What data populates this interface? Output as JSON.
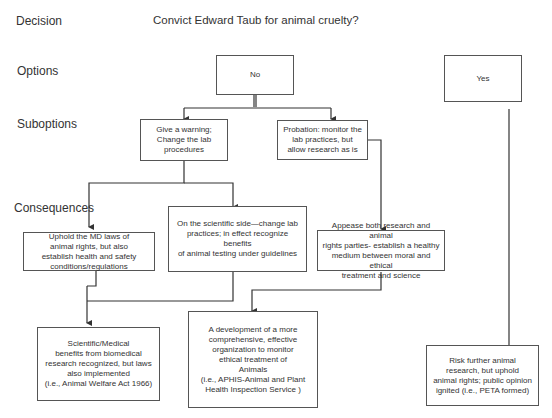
{
  "row_labels": {
    "decision": "Decision",
    "options": "Options",
    "suboptions": "Suboptions",
    "consequences": "Consequences"
  },
  "decision_question": "Convict Edward Taub for animal cruelty?",
  "options": {
    "no": "No",
    "yes": "Yes"
  },
  "suboptions": {
    "warning": "Give a warning;\nChange the lab\nprocedures",
    "probation": "Probation: monitor the\nlab practices, but\nallow research as is"
  },
  "consequences": {
    "uphold_md_laws": "Uphold the MD laws of\nanimal rights, but also\nestablish health and safety\nconditions/regulations",
    "scientific_side": "On the scientific side—change lab\npractices; in effect recognize benefits\nof animal testing under guidelines",
    "appease_both": "Appease both research and animal\nrights parties- establish a healthy\nmedium between moral and ethical\ntreatment and science"
  },
  "outcomes": {
    "scientific_medical": "Scientific/Medical\nbenefits from biomedical\nresearch recognized, but laws\nalso implemented\n(i.e., Animal Welfare Act 1966)",
    "development_org": "A development of a more\ncomprehensive, effective\norganization to monitor\nethical treatment of\nAnimals\n(i.e., APHIS-Animal and Plant\nHealth Inspection Service )",
    "risk_further": "Risk further animal\nresearch, but uphold\nanimal rights; public opinion\nignited (i.e., PETA formed)"
  },
  "colors": {
    "line": "#333333",
    "box_border": "#555555",
    "text": "#333333"
  }
}
